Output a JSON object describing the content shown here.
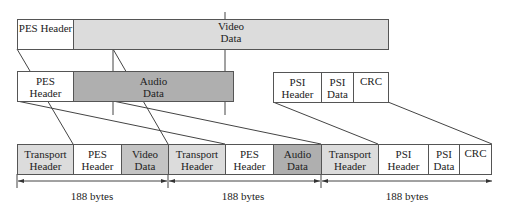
{
  "video_pes": {
    "header": "PES Header",
    "data": "Video\nData"
  },
  "audio_pes": {
    "header": "PES\nHeader",
    "data": "Audio\nData"
  },
  "psi_section": {
    "header": "PSI\nHeader",
    "data": "PSI\nData",
    "crc": "CRC"
  },
  "ts_packets": [
    {
      "cells": [
        "Transport\nHeader",
        "PES\nHeader",
        "Video\nData"
      ],
      "size_label": "188 bytes"
    },
    {
      "cells": [
        "Transport\nHeader",
        "PES\nHeader",
        "Audio\nData"
      ],
      "size_label": "188 bytes"
    },
    {
      "cells": [
        "Transport\nHeader",
        "PSI\nHeader",
        "PSI\nData",
        "CRC"
      ],
      "size_label": "188 bytes"
    }
  ],
  "colors": {
    "transport": "#dcdcdc",
    "video": "#c4c4c4",
    "audio": "#afafaf",
    "plain": "#ffffff"
  }
}
